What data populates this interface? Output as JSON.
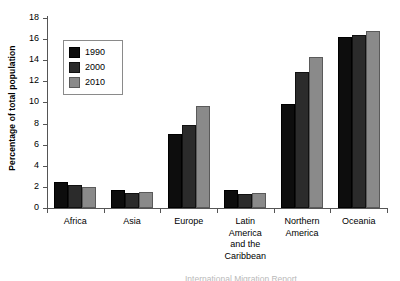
{
  "chart_data": {
    "type": "bar",
    "title": "",
    "xlabel": "",
    "ylabel": "Percentage of total population",
    "ylim": [
      0,
      18
    ],
    "yticks": [
      0,
      2,
      4,
      6,
      8,
      10,
      12,
      14,
      16,
      18
    ],
    "grid": false,
    "legend_position": "upper-left-inside",
    "categories": [
      "Africa",
      "Asia",
      "Europe",
      "Latin America and the Caribbean",
      "Northern America",
      "Oceania"
    ],
    "category_lines": [
      [
        "Africa"
      ],
      [
        "Asia"
      ],
      [
        "Europe"
      ],
      [
        "Latin",
        "America",
        "and the",
        "Caribbean"
      ],
      [
        "Northern",
        "America"
      ],
      [
        "Oceania"
      ]
    ],
    "series": [
      {
        "name": "1990",
        "color": "#0d0d0d",
        "values": [
          2.5,
          1.7,
          7.0,
          1.7,
          9.9,
          16.2
        ]
      },
      {
        "name": "2000",
        "color": "#2b2b2b",
        "values": [
          2.15,
          1.4,
          7.9,
          1.35,
          12.9,
          16.4
        ]
      },
      {
        "name": "2010",
        "color": "#8a8a8a",
        "values": [
          1.95,
          1.55,
          9.7,
          1.4,
          14.3,
          16.8
        ]
      }
    ]
  },
  "caption": {
    "clipped_text": "International Migration Report"
  }
}
